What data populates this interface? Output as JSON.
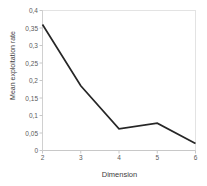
{
  "chart_data": {
    "type": "line",
    "title": "",
    "xlabel": "Dimension",
    "ylabel": "Mean exploitation rate",
    "x": [
      2,
      3,
      4,
      5,
      6
    ],
    "values": [
      0.36,
      0.185,
      0.062,
      0.078,
      0.02
    ],
    "series": [
      {
        "name": "Mean exploitation rate",
        "values": [
          0.36,
          0.185,
          0.062,
          0.078,
          0.02
        ]
      }
    ],
    "xlim": [
      2,
      6
    ],
    "ylim": [
      0,
      0.4
    ],
    "xticks": [
      "2",
      "3",
      "4",
      "5",
      "6"
    ],
    "yticks": [
      "0",
      "0,05",
      "0,1",
      "0,15",
      "0,2",
      "0,25",
      "0,3",
      "0,35",
      "0,4"
    ],
    "ytick_values": [
      0,
      0.05,
      0.1,
      0.15,
      0.2,
      0.25,
      0.3,
      0.35,
      0.4
    ],
    "grid": false,
    "legend": "none",
    "line_color": "#262626",
    "axis_color": "#d9d9d9",
    "text_color": "#3d3d3d"
  }
}
